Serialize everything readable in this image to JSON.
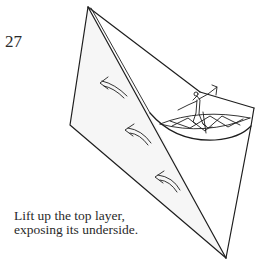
{
  "diagram": {
    "step_number": "27",
    "caption": {
      "line1": "Lift up the top layer,",
      "line2": "exposing its underside."
    },
    "elements": [
      {
        "name": "paper-model",
        "description": "folded paper kite/triangle shape"
      },
      {
        "name": "inner-crease",
        "description": "diagonal crease line from top vertex to bottom tip"
      },
      {
        "name": "arrow-lift-1",
        "icon": "curved-arrow-left"
      },
      {
        "name": "arrow-lift-2",
        "icon": "curved-arrow-left"
      },
      {
        "name": "arrow-lift-3",
        "icon": "curved-arrow-left"
      },
      {
        "name": "figure-skater-illustration",
        "description": "human figure standing on a patterned ellipse inside the pocket"
      }
    ],
    "colors": {
      "line": "#1e1e1e",
      "text": "#2a2a2a",
      "background": "#ffffff"
    }
  }
}
